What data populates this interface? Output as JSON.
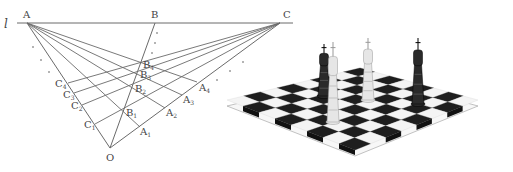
{
  "figure": {
    "left_panel": {
      "title": "perspective-construction",
      "line_label": "l",
      "colors": {
        "line": "#6a6a6a",
        "text": "#444444",
        "dot": "#555555"
      },
      "baseline": {
        "x1": 17,
        "y1": 23,
        "x2": 293,
        "y2": 23
      },
      "points": {
        "A": {
          "x": 27,
          "y": 23,
          "label": "A",
          "lx": 23,
          "ly": 18
        },
        "B": {
          "x": 155,
          "y": 23,
          "label": "B",
          "lx": 151,
          "ly": 18
        },
        "C": {
          "x": 280,
          "y": 23,
          "label": "C",
          "lx": 283,
          "ly": 18
        },
        "O": {
          "x": 110,
          "y": 148,
          "label": "O",
          "lx": 106,
          "ly": 161
        }
      },
      "c_points": [
        {
          "name": "C",
          "sub": "1",
          "x": 95,
          "y": 124,
          "lx": 84,
          "ly": 128
        },
        {
          "name": "C",
          "sub": "2",
          "x": 82,
          "y": 105,
          "lx": 71,
          "ly": 109
        },
        {
          "name": "C",
          "sub": "3",
          "x": 74,
          "y": 93,
          "lx": 63,
          "ly": 98
        },
        {
          "name": "C",
          "sub": "4",
          "x": 68,
          "y": 83,
          "lx": 55,
          "ly": 87
        }
      ],
      "a_points": [
        {
          "name": "A",
          "sub": "1",
          "x": 140,
          "y": 127,
          "lx": 140,
          "ly": 135
        },
        {
          "name": "A",
          "sub": "2",
          "x": 165,
          "y": 108,
          "lx": 166,
          "ly": 116
        },
        {
          "name": "A",
          "sub": "3",
          "x": 182,
          "y": 95,
          "lx": 183,
          "ly": 103
        },
        {
          "name": "A",
          "sub": "4",
          "x": 197,
          "y": 82,
          "lx": 199,
          "ly": 91
        }
      ],
      "b_points": [
        {
          "name": "B",
          "sub": "1",
          "x": 124,
          "y": 111,
          "lx": 126,
          "ly": 116
        },
        {
          "name": "B",
          "sub": "2",
          "x": 133,
          "y": 87,
          "lx": 135,
          "ly": 92
        },
        {
          "name": "B",
          "sub": "3",
          "x": 138,
          "y": 73,
          "lx": 140,
          "ly": 78
        },
        {
          "name": "B",
          "sub": "4",
          "x": 141,
          "y": 63,
          "lx": 143,
          "ly": 68
        }
      ],
      "dots": [
        {
          "x": 33,
          "y": 47
        },
        {
          "x": 41,
          "y": 60
        },
        {
          "x": 49,
          "y": 72
        },
        {
          "x": 157,
          "y": 33
        },
        {
          "x": 155,
          "y": 43
        },
        {
          "x": 152,
          "y": 53
        },
        {
          "x": 243,
          "y": 62
        },
        {
          "x": 230,
          "y": 71
        },
        {
          "x": 217,
          "y": 80
        }
      ]
    },
    "right_panel": {
      "title": "chess-board-illustration",
      "colors": {
        "dark": "#1e1e1e",
        "light": "#f4f4f4",
        "edge": "#9a9a9a",
        "piece_dark": "#2a2a2a",
        "piece_light": "#e6e6e6"
      },
      "board": {
        "top": {
          "x": 360,
          "y": 68
        },
        "right": {
          "x": 478,
          "y": 100
        },
        "bottom": {
          "x": 355,
          "y": 150
        },
        "left": {
          "x": 227,
          "y": 100
        },
        "size": 8
      },
      "pieces": [
        {
          "name": "dark-rook",
          "x": 324,
          "base_y": 96,
          "height": 52,
          "tone": "dark"
        },
        {
          "name": "light-king",
          "x": 333,
          "base_y": 122,
          "height": 80,
          "tone": "light"
        },
        {
          "name": "light-bishop",
          "x": 368,
          "base_y": 100,
          "height": 62,
          "tone": "light"
        },
        {
          "name": "dark-queen",
          "x": 418,
          "base_y": 104,
          "height": 66,
          "tone": "dark"
        }
      ]
    }
  }
}
